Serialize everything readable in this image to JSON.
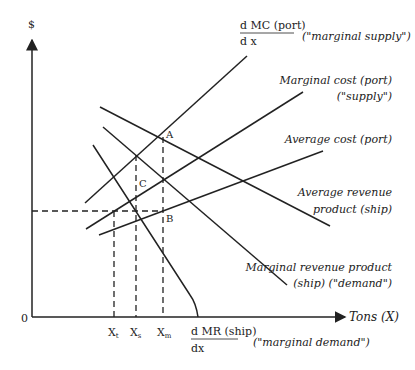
{
  "axes": {
    "y_label": "$",
    "x_label": "Tons (X)",
    "origin_label": "0"
  },
  "x_ticks": [
    "X",
    "X",
    "X"
  ],
  "x_tick_subs": [
    "t",
    "s",
    "m"
  ],
  "points": {
    "A": "A",
    "B": "B",
    "C": "C"
  },
  "curves": {
    "dmc": {
      "num": "d MC (port)",
      "den": "d x",
      "note": "(\"marginal supply\")"
    },
    "mc": {
      "line1": "Marginal cost (port)",
      "line2": "(\"supply\")"
    },
    "ac": {
      "line1": "Average cost (port)"
    },
    "arp": {
      "line1": "Average revenue",
      "line2": "product (ship)"
    },
    "mrp": {
      "line1": "Marginal revenue product",
      "line2": "(ship) (\"demand\")"
    },
    "dmr": {
      "num": "d MR (ship)",
      "den": "dx",
      "note": "(\"marginal demand\")"
    }
  }
}
